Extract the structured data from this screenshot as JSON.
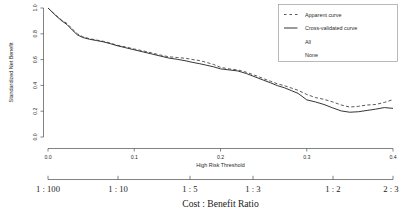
{
  "chart_data": {
    "type": "line",
    "title": "",
    "xlabel": "High Risk Threshold",
    "ylabel": "Standardized Net Benefit",
    "xlim": [
      0.0,
      0.4
    ],
    "ylim": [
      0.0,
      1.0
    ],
    "grid": false,
    "legend_position": "top-right",
    "xticks": [
      "0.0",
      "0.1",
      "0.2",
      "0.3",
      "0.4"
    ],
    "xtick_values": [
      0.0,
      0.1,
      0.2,
      0.3,
      0.4
    ],
    "yticks": [
      "0.0",
      "0.2",
      "0.4",
      "0.6",
      "0.8",
      "1.0"
    ],
    "ytick_values": [
      0.0,
      0.2,
      0.4,
      0.6,
      0.8,
      1.0
    ],
    "secondary_axis": {
      "label": "Cost : Benefit Ratio",
      "ticks": [
        "1 : 100",
        "1 : 10",
        "1 : 5",
        "1 : 3",
        "1 : 2",
        "2 : 3"
      ],
      "tick_values": [
        0.0099,
        0.0909,
        0.1667,
        0.25,
        0.3333,
        0.4
      ]
    },
    "series": [
      {
        "name": "Apparent curve",
        "style": "dashed",
        "color": "#3a3a3a",
        "x": [
          0.0,
          0.008,
          0.016,
          0.022,
          0.028,
          0.034,
          0.04,
          0.048,
          0.056,
          0.064,
          0.072,
          0.08,
          0.09,
          0.1,
          0.11,
          0.12,
          0.13,
          0.14,
          0.15,
          0.16,
          0.168,
          0.176,
          0.184,
          0.192,
          0.2,
          0.21,
          0.22,
          0.23,
          0.24,
          0.25,
          0.258,
          0.266,
          0.274,
          0.282,
          0.29,
          0.3,
          0.31,
          0.32,
          0.33,
          0.34,
          0.35,
          0.36,
          0.37,
          0.38,
          0.39,
          0.4
        ],
        "y": [
          1.0,
          0.95,
          0.905,
          0.88,
          0.838,
          0.8,
          0.778,
          0.762,
          0.752,
          0.742,
          0.728,
          0.712,
          0.698,
          0.682,
          0.668,
          0.652,
          0.636,
          0.622,
          0.616,
          0.61,
          0.6,
          0.592,
          0.578,
          0.562,
          0.54,
          0.528,
          0.52,
          0.502,
          0.478,
          0.452,
          0.432,
          0.412,
          0.398,
          0.38,
          0.362,
          0.33,
          0.306,
          0.292,
          0.272,
          0.248,
          0.232,
          0.238,
          0.248,
          0.252,
          0.268,
          0.29
        ]
      },
      {
        "name": "Cross-validated curve",
        "style": "solid",
        "color": "#2a2a2a",
        "x": [
          0.0,
          0.008,
          0.016,
          0.022,
          0.028,
          0.034,
          0.04,
          0.048,
          0.056,
          0.064,
          0.072,
          0.08,
          0.09,
          0.1,
          0.11,
          0.12,
          0.13,
          0.14,
          0.15,
          0.16,
          0.168,
          0.176,
          0.184,
          0.192,
          0.2,
          0.21,
          0.22,
          0.23,
          0.24,
          0.25,
          0.258,
          0.266,
          0.274,
          0.282,
          0.29,
          0.3,
          0.31,
          0.32,
          0.33,
          0.34,
          0.35,
          0.36,
          0.37,
          0.38,
          0.39,
          0.4
        ],
        "y": [
          1.0,
          0.948,
          0.9,
          0.872,
          0.83,
          0.792,
          0.772,
          0.758,
          0.748,
          0.738,
          0.724,
          0.708,
          0.692,
          0.676,
          0.66,
          0.644,
          0.628,
          0.612,
          0.602,
          0.59,
          0.578,
          0.568,
          0.556,
          0.544,
          0.528,
          0.52,
          0.512,
          0.492,
          0.466,
          0.44,
          0.42,
          0.398,
          0.382,
          0.36,
          0.338,
          0.288,
          0.272,
          0.252,
          0.226,
          0.202,
          0.192,
          0.196,
          0.206,
          0.216,
          0.228,
          0.222
        ]
      },
      {
        "name": "All",
        "style": "solid-thin",
        "color": "#555555",
        "x": [],
        "y": []
      },
      {
        "name": "None",
        "style": "solid-thin",
        "color": "#555555",
        "x": [],
        "y": []
      }
    ]
  },
  "legend": {
    "items": [
      {
        "label": "Apparent curve",
        "style": "dashed"
      },
      {
        "label": "Cross-validated curve",
        "style": "solid"
      },
      {
        "label": "All",
        "style": "none"
      },
      {
        "label": "None",
        "style": "none"
      }
    ]
  }
}
